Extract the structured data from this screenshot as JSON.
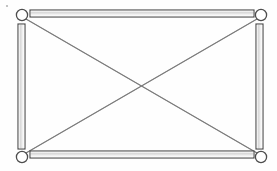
{
  "figure": {
    "background_color": "#fefefe",
    "ink_color": "#4a4a4a",
    "brace_color": "#8d8d8d",
    "joint_fill_color": "#ffffff",
    "width_px": 277,
    "height_px": 171
  },
  "diagram": {
    "type": "structural-frame",
    "member_style": "double-line-hollow-bar",
    "brace_style": "single-thin-line",
    "joint_style": "open-circle-pin"
  },
  "joints": [
    {
      "id": "A",
      "label": "",
      "position": "top-left",
      "cx": 22,
      "cy": 15,
      "r": 5.6
    },
    {
      "id": "B",
      "label": "",
      "position": "top-right",
      "cx": 261,
      "cy": 15,
      "r": 5.6
    },
    {
      "id": "C",
      "label": "",
      "position": "bottom-left",
      "cx": 22,
      "cy": 157,
      "r": 5.6
    },
    {
      "id": "D",
      "label": "",
      "position": "bottom-right",
      "cx": 261,
      "cy": 157,
      "r": 5.6
    }
  ],
  "members": [
    {
      "id": "AB",
      "label": "",
      "role": "top-chord",
      "orientation": "horizontal",
      "x": 30,
      "y": 10,
      "w": 224,
      "h": 7
    },
    {
      "id": "CD",
      "label": "",
      "role": "bottom-chord",
      "orientation": "horizontal",
      "x": 30,
      "y": 151,
      "w": 224,
      "h": 7
    },
    {
      "id": "AC",
      "label": "",
      "role": "left-post",
      "orientation": "vertical",
      "x": 18,
      "y": 24,
      "w": 7,
      "h": 125
    },
    {
      "id": "BD",
      "label": "",
      "role": "right-post",
      "orientation": "vertical",
      "x": 256,
      "y": 24,
      "w": 7,
      "h": 125
    }
  ],
  "braces": [
    {
      "id": "AD",
      "label": "",
      "role": "diagonal-brace",
      "from": "A",
      "to": "D",
      "x1": 26,
      "y1": 19,
      "x2": 257,
      "y2": 153
    },
    {
      "id": "BC",
      "label": "",
      "role": "diagonal-brace",
      "from": "B",
      "to": "C",
      "x1": 257,
      "y1": 19,
      "x2": 26,
      "y2": 153
    }
  ],
  "crossing_point": {
    "x": 141,
    "y": 86,
    "jointed": false
  },
  "marks": [
    {
      "id": "speck-1",
      "kind": "scan-artifact",
      "x": 7,
      "y": 6,
      "r": 1.1
    }
  ],
  "annotations": {
    "labels": [],
    "dimensions": [],
    "caption": ""
  }
}
